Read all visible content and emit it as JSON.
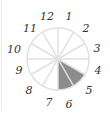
{
  "diagram": {
    "type": "clock-fraction-circle",
    "sectors": 12,
    "shaded_sectors": [
      4,
      5
    ],
    "shaded_description": "sectors from 4 to 6",
    "colors": {
      "line": "#e0e0e0",
      "shade": "#8c8c8c",
      "text": "#333333"
    },
    "labels": [
      "12",
      "1",
      "2",
      "3",
      "4",
      "5",
      "6",
      "7",
      "8",
      "9",
      "10",
      "11"
    ]
  }
}
